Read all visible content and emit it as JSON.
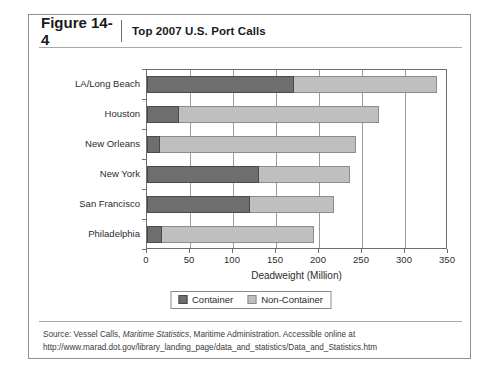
{
  "figure": {
    "number": "Figure 14-4",
    "caption": "Top 2007 U.S. Port Calls"
  },
  "source": {
    "prefix": "Source: Vessel Calls, ",
    "italic": "Maritime Statistics",
    "suffix": ", Maritime Administration. Accessible online at http://www.marad.dot.gov/library_landing_page/data_and_statistics/Data_and_Statistics.htm"
  },
  "legend": {
    "items": [
      {
        "label": "Container",
        "color": "#6e6e6e"
      },
      {
        "label": "Non-Container",
        "color": "#bfbfbf"
      }
    ]
  },
  "chart_data": {
    "type": "bar",
    "orientation": "horizontal",
    "stacked": true,
    "title": "Top 2007 U.S. Port Calls",
    "xlabel": "Deadweight (Million)",
    "ylabel": "",
    "xlim": [
      0,
      350
    ],
    "xticks": [
      0,
      50,
      100,
      150,
      200,
      250,
      300,
      350
    ],
    "xticklabels": [
      "0",
      "50",
      "100",
      "150",
      "200",
      "250",
      "300",
      "350"
    ],
    "grid": true,
    "legend_position": "bottom",
    "categories": [
      "LA/Long Beach",
      "Houston",
      "New Orleans",
      "New York",
      "San Francisco",
      "Philadelphia"
    ],
    "series": [
      {
        "name": "Container",
        "color": "#6e6e6e",
        "values": [
          171,
          37,
          15,
          130,
          120,
          18
        ]
      },
      {
        "name": "Non-Container",
        "color": "#bfbfbf",
        "values": [
          166,
          233,
          228,
          106,
          97,
          176
        ]
      }
    ],
    "totals": [
      337,
      270,
      243,
      236,
      217,
      194
    ]
  }
}
